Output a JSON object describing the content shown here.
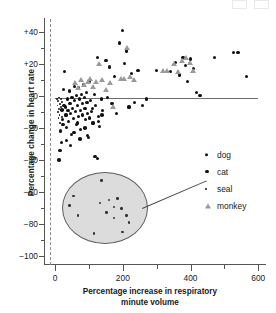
{
  "chart_data": {
    "type": "scatter",
    "title": "",
    "xlabel": "Percentage increase in respiratory minute volume",
    "ylabel": "Percentage change in heart rate",
    "xlim": [
      -30,
      620
    ],
    "ylim": [
      -105,
      48
    ],
    "xticks": [
      0,
      200,
      400,
      600
    ],
    "xticklabels": [
      "0",
      "200",
      "400",
      "600"
    ],
    "xminor": [
      100,
      300,
      500
    ],
    "yticks": [
      40,
      20,
      0,
      -20,
      -40,
      -60,
      -80,
      -100
    ],
    "yticklabels": [
      "+40",
      "+20",
      "0",
      "−20",
      "−40",
      "−60",
      "−80",
      "−100"
    ],
    "yminor": [
      30,
      10,
      -10,
      -30,
      -50,
      -70,
      -90
    ],
    "grid": false,
    "legend_position": "right-middle",
    "annotations": [
      {
        "kind": "reference-line",
        "orientation": "vertical",
        "x": 0,
        "style": "dashed",
        "color": "#8a8a8a"
      },
      {
        "kind": "trend-line",
        "orientation": "horizontal",
        "y": -1.5,
        "x_from": 0,
        "x_to": 600,
        "color": "#6e6e6e"
      },
      {
        "kind": "inset-magnifier",
        "shape": "ellipse",
        "center_x": 110,
        "center_y": -68,
        "note": "magnified view of seal cluster",
        "fill": "#dcdcdc",
        "edge": "#5e5e5e"
      },
      {
        "kind": "leader-line",
        "from": "inset-ellipse-right-edge",
        "to": "seal-legend-marker",
        "color": "#4a4a4a"
      }
    ],
    "series": [
      {
        "name": "dog",
        "marker": "circle",
        "color": "#111111",
        "size": 3.2,
        "points": [
          [
            18,
            -29
          ],
          [
            22,
            -15
          ],
          [
            25,
            4
          ],
          [
            28,
            15
          ],
          [
            30,
            -7
          ],
          [
            32,
            -12
          ],
          [
            34,
            -20
          ],
          [
            36,
            -2
          ],
          [
            38,
            -9
          ],
          [
            40,
            -16
          ],
          [
            42,
            3
          ],
          [
            44,
            -5
          ],
          [
            46,
            -11
          ],
          [
            48,
            -24
          ],
          [
            50,
            -1
          ],
          [
            52,
            -8
          ],
          [
            54,
            -14
          ],
          [
            56,
            6
          ],
          [
            58,
            -3
          ],
          [
            60,
            -10
          ],
          [
            62,
            -18
          ],
          [
            64,
            0
          ],
          [
            66,
            -6
          ],
          [
            68,
            -13
          ],
          [
            70,
            5
          ],
          [
            72,
            -2
          ],
          [
            74,
            -9
          ],
          [
            76,
            -21
          ],
          [
            78,
            1
          ],
          [
            80,
            -5
          ],
          [
            82,
            -12
          ],
          [
            84,
            7
          ],
          [
            86,
            -1
          ],
          [
            88,
            -8
          ],
          [
            90,
            -15
          ],
          [
            92,
            2
          ],
          [
            94,
            -4
          ],
          [
            96,
            -11
          ],
          [
            98,
            -26
          ],
          [
            100,
            9
          ],
          [
            104,
            -3
          ],
          [
            108,
            -10
          ],
          [
            112,
            -17
          ],
          [
            116,
            1
          ],
          [
            120,
            -6
          ],
          [
            124,
            24
          ],
          [
            128,
            -13
          ],
          [
            132,
            -19
          ],
          [
            136,
            -2
          ],
          [
            140,
            -9
          ],
          [
            150,
            22
          ],
          [
            155,
            -1
          ],
          [
            160,
            18
          ],
          [
            168,
            -5
          ],
          [
            175,
            12
          ],
          [
            182,
            -11
          ],
          [
            190,
            33
          ],
          [
            200,
            41
          ],
          [
            205,
            20
          ],
          [
            212,
            28
          ],
          [
            218,
            -7
          ],
          [
            225,
            14
          ],
          [
            235,
            -4
          ],
          [
            245,
            16
          ],
          [
            258,
            -6
          ],
          [
            270,
            -2
          ],
          [
            300,
            16
          ],
          [
            340,
            15
          ],
          [
            355,
            21
          ],
          [
            368,
            13
          ],
          [
            378,
            24
          ],
          [
            385,
            19
          ],
          [
            392,
            9
          ],
          [
            400,
            23
          ],
          [
            408,
            17
          ],
          [
            418,
            2
          ],
          [
            428,
            0
          ],
          [
            470,
            24
          ],
          [
            528,
            27
          ],
          [
            540,
            27
          ],
          [
            565,
            12
          ],
          [
            118,
            -38
          ],
          [
            126,
            -39
          ],
          [
            95,
            -25
          ]
        ]
      },
      {
        "name": "cat",
        "marker": "circle",
        "color": "#111111",
        "size": 3.6,
        "points": [
          [
            12,
            -40
          ],
          [
            14,
            -34
          ],
          [
            16,
            -22
          ],
          [
            20,
            -9
          ],
          [
            24,
            -18
          ],
          [
            26,
            -6
          ],
          [
            33,
            -28
          ],
          [
            45,
            -31
          ],
          [
            55,
            -23
          ],
          [
            66,
            -17
          ],
          [
            74,
            -27
          ],
          [
            88,
            -20
          ],
          [
            102,
            -14
          ],
          [
            110,
            -8
          ],
          [
            128,
            -16
          ],
          [
            138,
            -12
          ]
        ]
      },
      {
        "name": "seal",
        "marker": "circle",
        "color": "#111111",
        "size": 1.9,
        "note": "tight cluster near origin, magnified in inset ellipse",
        "points": [
          [
            6,
            -2
          ],
          [
            7,
            -6
          ],
          [
            8,
            -10
          ],
          [
            9,
            -3
          ],
          [
            10,
            -14
          ],
          [
            11,
            -8
          ],
          [
            12,
            -1
          ],
          [
            13,
            -12
          ],
          [
            14,
            -5
          ],
          [
            15,
            -17
          ],
          [
            16,
            -9
          ],
          [
            17,
            -2
          ],
          [
            18,
            -7
          ],
          [
            19,
            -13
          ],
          [
            20,
            -4
          ]
        ]
      },
      {
        "name": "monkey",
        "marker": "triangle",
        "color": "#9a9a9a",
        "size": 5,
        "points": [
          [
            58,
            8
          ],
          [
            68,
            5
          ],
          [
            78,
            10
          ],
          [
            86,
            7
          ],
          [
            96,
            9
          ],
          [
            104,
            11
          ],
          [
            112,
            6
          ],
          [
            120,
            9
          ],
          [
            130,
            20
          ],
          [
            140,
            10
          ],
          [
            150,
            4
          ],
          [
            162,
            8
          ],
          [
            172,
            -7
          ],
          [
            196,
            11
          ],
          [
            205,
            11
          ],
          [
            212,
            30
          ],
          [
            222,
            12
          ],
          [
            232,
            10
          ],
          [
            318,
            16
          ],
          [
            330,
            16
          ],
          [
            350,
            20
          ],
          [
            362,
            15
          ],
          [
            375,
            22
          ],
          [
            388,
            24
          ],
          [
            398,
            21
          ],
          [
            408,
            16
          ]
        ]
      }
    ],
    "inset_points": {
      "note": "magnified seal points drawn inside the grey ellipse",
      "coords": [
        [
          0.47,
          0.12
        ],
        [
          0.14,
          0.34
        ],
        [
          0.09,
          0.48
        ],
        [
          0.19,
          0.62
        ],
        [
          0.45,
          0.44
        ],
        [
          0.56,
          0.4
        ],
        [
          0.66,
          0.38
        ],
        [
          0.62,
          0.5
        ],
        [
          0.53,
          0.58
        ],
        [
          0.71,
          0.52
        ],
        [
          0.77,
          0.62
        ],
        [
          0.8,
          0.72
        ],
        [
          0.62,
          0.66
        ],
        [
          0.38,
          0.88
        ],
        [
          0.72,
          0.86
        ]
      ]
    }
  },
  "legend": {
    "items": [
      {
        "label": "dog",
        "marker": "circle",
        "color": "#111111"
      },
      {
        "label": "cat",
        "marker": "circle",
        "color": "#111111"
      },
      {
        "label": "seal",
        "marker": "circle",
        "color": "#111111"
      },
      {
        "label": "monkey",
        "marker": "triangle",
        "color": "#9a9a9a"
      }
    ]
  },
  "axes": {
    "x_title_line1": "Percentage increase in respiratory",
    "x_title_line2": "minute volume",
    "y_title": "Percentage change in heart rate"
  }
}
